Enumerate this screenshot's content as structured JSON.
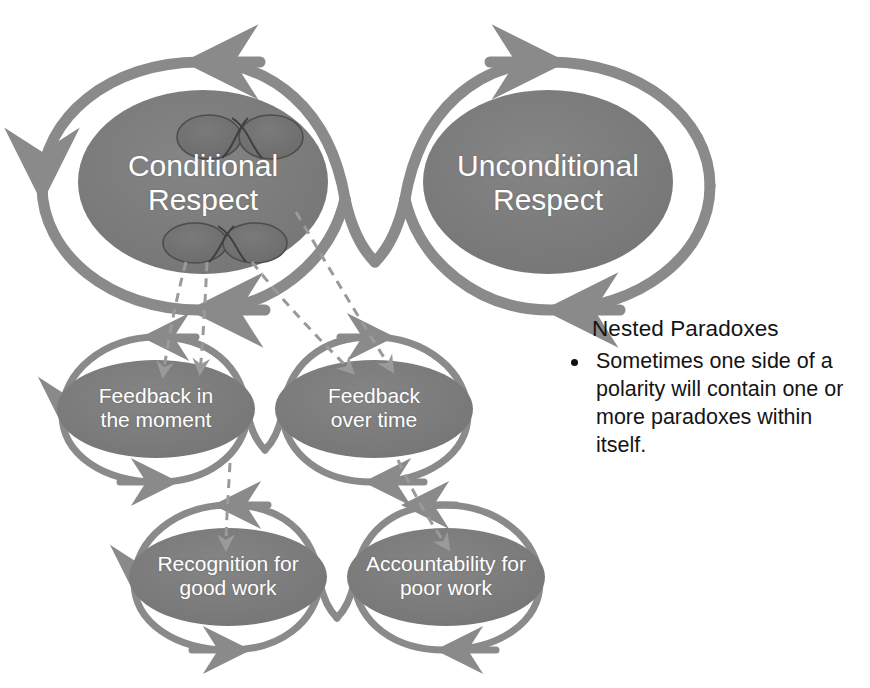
{
  "diagram": {
    "title_text": "Nested Paradoxes",
    "colors": {
      "ellipse_fill": "#7d7d7d",
      "nested_ellipse_fill": "#6e6e6e",
      "loop_stroke": "#8a8a8a",
      "infinity_stroke": "#4a4a4a",
      "dashed_stroke": "#9a9a9a",
      "label_text": "#ffffff",
      "body_text": "#141414",
      "background": "#ffffff"
    },
    "tiers": [
      {
        "name": "tier-1-primary-polarity",
        "poles": [
          {
            "id": "conditional-respect",
            "label": "Conditional\nRespect",
            "cx": 203,
            "cy": 182,
            "rx": 125,
            "ry": 92
          },
          {
            "id": "unconditional-respect",
            "label": "Unconditional\nRespect",
            "cx": 548,
            "cy": 182,
            "rx": 125,
            "ry": 92
          }
        ]
      },
      {
        "name": "tier-2-nested-polarity",
        "poles": [
          {
            "id": "feedback-in-the-moment",
            "label": "Feedback in\nthe moment",
            "cx": 156,
            "cy": 409,
            "rx": 99,
            "ry": 49
          },
          {
            "id": "feedback-over-time",
            "label": "Feedback\nover time",
            "cx": 374,
            "cy": 409,
            "rx": 99,
            "ry": 49
          }
        ]
      },
      {
        "name": "tier-3-nested-polarity",
        "poles": [
          {
            "id": "recognition-for-good-work",
            "label": "Recognition for\ngood work",
            "cx": 228,
            "cy": 577,
            "rx": 99,
            "ry": 49
          },
          {
            "id": "accountability-for-poor-work",
            "label": "Accountability for\npoor work",
            "cx": 446,
            "cy": 577,
            "rx": 99,
            "ry": 49
          }
        ]
      }
    ],
    "nested_markers": [
      {
        "id": "infinity-marker-upper",
        "cx": 236,
        "cy": 137,
        "w": 112,
        "h": 48
      },
      {
        "id": "infinity-marker-lower",
        "cx": 222,
        "cy": 243,
        "w": 112,
        "h": 48
      }
    ]
  },
  "notes": {
    "heading": "Nested Paradoxes",
    "bullets": [
      "Sometimes one side of a polarity will contain one or more paradoxes within itself."
    ]
  }
}
